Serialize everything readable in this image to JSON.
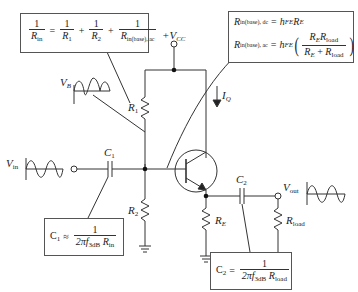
{
  "labels": {
    "vcc": "+V",
    "vcc_sub": "CC",
    "vb": "V",
    "vb_sub": "B",
    "vin": "V",
    "vin_sub": "in",
    "vout": "V",
    "vout_sub": "out",
    "r1": "R",
    "r1_sub": "1",
    "r2": "R",
    "r2_sub": "2",
    "re": "R",
    "re_sub": "E",
    "rload": "R",
    "rload_sub": "load",
    "c1": "C",
    "c1_sub": "1",
    "c2": "C",
    "c2_sub": "2",
    "iq": "I",
    "iq_sub": "Q"
  },
  "equations": {
    "rin": {
      "lhs_num": "1",
      "lhs_den": "R",
      "lhs_den_sub": "in",
      "eq": "=",
      "t1_num": "1",
      "t1_den": "R",
      "t1_den_sub": "1",
      "plus1": "+",
      "t2_num": "1",
      "t2_den": "R",
      "t2_den_sub": "2",
      "plus2": "+",
      "t3_num": "1",
      "t3_den": "R",
      "t3_den_sub": "in(base), ac"
    },
    "rbase": {
      "line1_lhs": "R",
      "line1_lhs_sub": "in(base), dc",
      "line1_eq": "=",
      "line1_rhs": "h",
      "line1_rhs_sub": "FE",
      "line1_rhs2": "R",
      "line1_rhs2_sub": "E",
      "line2_lhs": "R",
      "line2_lhs_sub": "in(base), ac",
      "line2_eq": "=",
      "line2_rhs": "h",
      "line2_rhs_sub": "FE",
      "frac_num_a": "R",
      "frac_num_a_sub": "E",
      "frac_num_b": "R",
      "frac_num_b_sub": "load",
      "frac_den_a": "R",
      "frac_den_a_sub": "E",
      "frac_den_plus": "+",
      "frac_den_b": "R",
      "frac_den_b_sub": "load"
    },
    "c1": {
      "lhs": "C",
      "lhs_sub": "1",
      "approx": "≈",
      "num": "1",
      "den_a": "2πf",
      "den_a_sub": "3dB",
      "den_b": "R",
      "den_b_sub": "in"
    },
    "c2": {
      "lhs": "C",
      "lhs_sub": "2",
      "approx": "=",
      "num": "1",
      "den_a": "2πf",
      "den_a_sub": "3dB",
      "den_b": "R",
      "den_b_sub": "load"
    }
  },
  "colors": {
    "wire": "#333333",
    "box_border": "#555555"
  }
}
